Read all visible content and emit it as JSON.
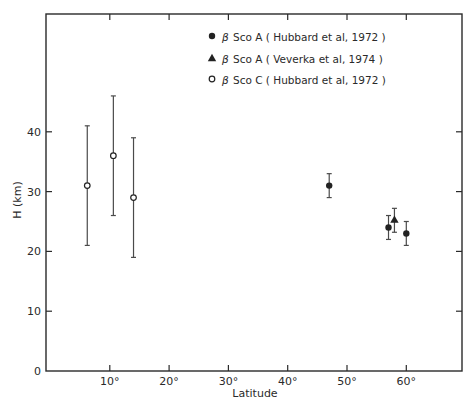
{
  "chart_data": {
    "type": "scatter",
    "title": "",
    "xlabel": "Latitude",
    "ylabel": "H (km)",
    "xlim": [
      0,
      70
    ],
    "ylim": [
      0,
      50
    ],
    "x_ticks": [
      10,
      20,
      30,
      40,
      50,
      60
    ],
    "x_tick_labels": [
      "10°",
      "20°",
      "30°",
      "40°",
      "50°",
      "60°"
    ],
    "y_ticks": [
      0,
      10,
      20,
      30,
      40
    ],
    "y_tick_labels": [
      "0",
      "10",
      "20",
      "30",
      "40"
    ],
    "grid": false,
    "legend_position": "upper center",
    "series": [
      {
        "name": "β Sco A ( Hubbard et al, 1972 )",
        "marker": "filled-circle",
        "points": [
          {
            "x": 47,
            "y": 31,
            "err_low": 29,
            "err_high": 33
          },
          {
            "x": 57,
            "y": 24,
            "err_low": 22,
            "err_high": 26
          },
          {
            "x": 60,
            "y": 23,
            "err_low": 21,
            "err_high": 25
          }
        ]
      },
      {
        "name": "β Sco A ( Veverka et al, 1974 )",
        "marker": "filled-triangle",
        "points": [
          {
            "x": 58,
            "y": 25.3,
            "err_low": 23.2,
            "err_high": 27.2
          }
        ]
      },
      {
        "name": "β Sco C ( Hubbard et al, 1972 )",
        "marker": "open-circle",
        "points": [
          {
            "x": 6.2,
            "y": 31,
            "err_low": 21,
            "err_high": 41
          },
          {
            "x": 10.6,
            "y": 36,
            "err_low": 26,
            "err_high": 46
          },
          {
            "x": 14,
            "y": 29,
            "err_low": 19,
            "err_high": 39
          }
        ]
      }
    ]
  },
  "legend": {
    "items": [
      {
        "marker": "filled-circle",
        "greek": "β",
        "label": "Sco A ( Hubbard et al, 1972 )"
      },
      {
        "marker": "filled-triangle",
        "greek": "β",
        "label": "Sco A ( Veverka et al, 1974 )"
      },
      {
        "marker": "open-circle",
        "greek": "β",
        "label": "Sco C ( Hubbard et al, 1972 )"
      }
    ]
  },
  "axes": {
    "xlabel": "Latitude",
    "ylabel": "H (km)"
  }
}
